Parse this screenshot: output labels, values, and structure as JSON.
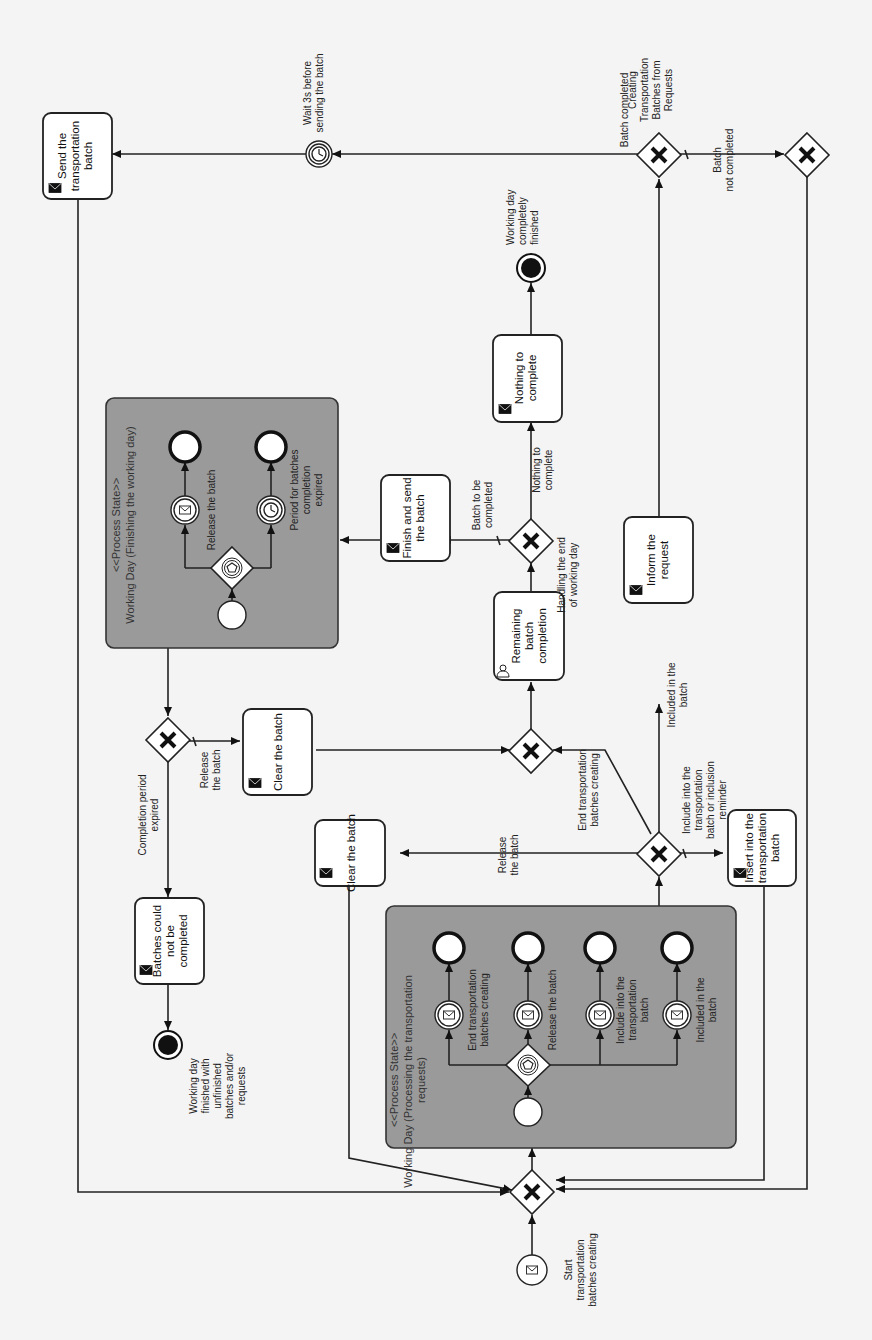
{
  "diagram": {
    "type": "BPMN process",
    "orientation": "rotated 90° counter-clockwise",
    "start_event": {
      "label": "Start transportation batches creating",
      "trigger": "message"
    },
    "process_states": [
      {
        "id": "p1",
        "stereotype": "<<Process State>>",
        "title": "Working Day (Processing the transportation requests)",
        "gateway": "event-based",
        "branches": [
          {
            "label": "End transportation batches creating",
            "trigger": "message"
          },
          {
            "label": "Release the batch",
            "trigger": "message"
          },
          {
            "label": "Include into the transportation batch",
            "trigger": "message"
          },
          {
            "label": "Included in the batch",
            "trigger": "message"
          }
        ]
      },
      {
        "id": "p2",
        "stereotype": "<<Process State>>",
        "title": "Working Day (Finishing the working day)",
        "gateway": "event-based",
        "branches": [
          {
            "label": "Release the batch",
            "trigger": "message"
          },
          {
            "label": "Period for batches completion expired",
            "trigger": "timer"
          }
        ]
      }
    ],
    "tasks": [
      {
        "id": "t_clear1",
        "label": "Clear the batch",
        "icon": "send-message"
      },
      {
        "id": "t_insert",
        "label": "Insert into the transportation batch",
        "icon": "send-message"
      },
      {
        "id": "t_inform",
        "label": "Inform the request",
        "icon": "send-message"
      },
      {
        "id": "t_send",
        "label": "Send the transportation batch",
        "icon": "send-message"
      },
      {
        "id": "t_remaining",
        "label": "Remaining batch completion",
        "icon": "user"
      },
      {
        "id": "t_finish",
        "label": "Finish and send the batch",
        "icon": "send-message"
      },
      {
        "id": "t_nothing",
        "label": "Nothing to complete",
        "icon": "send-message"
      },
      {
        "id": "t_clear2",
        "label": "Clear the batch",
        "icon": "send-message"
      },
      {
        "id": "t_could_not",
        "label": "Batches could not be completed",
        "icon": "send-message"
      }
    ],
    "gateways": [
      {
        "id": "g_merge_main",
        "type": "exclusive"
      },
      {
        "id": "g_p1_out",
        "type": "exclusive",
        "label": ""
      },
      {
        "id": "g_creating",
        "type": "exclusive",
        "label": "Creating Transportation Batches from Requests"
      },
      {
        "id": "g_not_completed",
        "type": "exclusive"
      },
      {
        "id": "g_merge_end",
        "type": "exclusive"
      },
      {
        "id": "g_handling",
        "type": "exclusive",
        "label": "Handling the end of working day"
      },
      {
        "id": "g_p2_out",
        "type": "exclusive"
      }
    ],
    "intermediate_events": [
      {
        "id": "e_wait",
        "label": "Wait 3s before sending the batch",
        "trigger": "timer"
      }
    ],
    "end_events": [
      {
        "id": "e_day_done",
        "label": "Working day completely finished"
      },
      {
        "id": "e_unfinished",
        "label": "Working day finished with unfinished batches and/or requests"
      }
    ],
    "flow_labels": {
      "release_batch_1": "Release the batch",
      "end_creating": "End transportation batches creating",
      "include_into": "Include into the transportation batch or inclusion reminder",
      "included_in": "Included in the batch",
      "batch_completed": "Batch completed",
      "batch_not_completed": "Batch not completed",
      "batch_to_be_completed": "Batch to be completed",
      "nothing_to_complete": "Nothing to complete",
      "release_batch_2": "Release the batch",
      "completion_period_expired": "Completion period expired"
    }
  }
}
